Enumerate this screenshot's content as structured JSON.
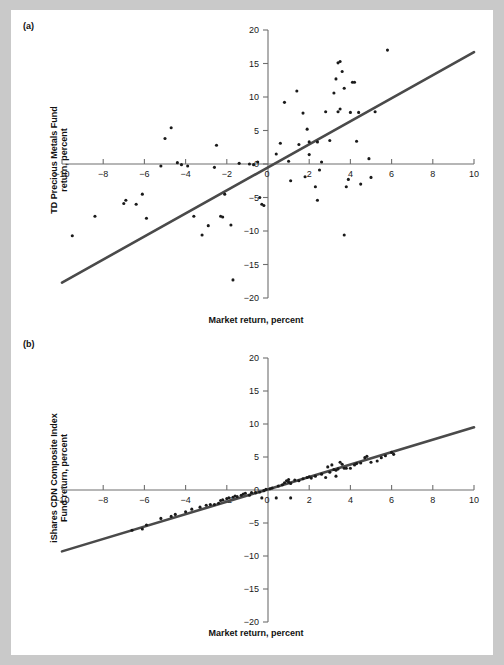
{
  "figure": {
    "background": "#c9c9c9",
    "sheet_color": "#ffffff",
    "axis_color": "#6f6f6f",
    "line_color": "#4a4a4a",
    "point_color": "#1a1a1a"
  },
  "panels": {
    "a": {
      "tag": "(a)",
      "ylabel_line1": "TD Precious Metals Fund",
      "ylabel_line2": "return, percent",
      "xlabel": "Market return, percent"
    },
    "b": {
      "tag": "(b)",
      "ylabel_line1": "iShares CDN Composite Index",
      "ylabel_line2": "Fund return, percent",
      "xlabel": "Market return, percent"
    }
  },
  "chart_data": [
    {
      "type": "scatter",
      "panel": "(a)",
      "title": "",
      "xlabel": "Market return, percent",
      "ylabel": "TD Precious Metals Fund return, percent",
      "xlim": [
        -10,
        10
      ],
      "ylim": [
        -20,
        20
      ],
      "xticks": [
        -10,
        -8,
        -6,
        -4,
        -2,
        0,
        2,
        4,
        6,
        8,
        10
      ],
      "yticks": [
        20,
        15,
        10,
        5,
        0,
        -5,
        -10,
        -15,
        -20
      ],
      "xticklabels": [
        "-10",
        "-8",
        "-6",
        "-4",
        "-2",
        "0",
        "2",
        "4",
        "6",
        "8",
        "10"
      ],
      "yticklabels": [
        "20",
        "15",
        "10",
        "5",
        "0",
        "-5",
        "-10",
        "-15",
        "-20"
      ],
      "grid": false,
      "legend": null,
      "fit_line": {
        "type": "linear",
        "slope": 1.72,
        "intercept": -0.5,
        "x_start": -10.0,
        "x_end": 10.0,
        "y_start": -17.7,
        "y_end": 16.7
      },
      "points": [
        [
          -9.5,
          -10.7
        ],
        [
          -8.4,
          -7.8
        ],
        [
          -7.0,
          -5.9
        ],
        [
          -6.9,
          -5.4
        ],
        [
          -6.4,
          -6.0
        ],
        [
          -6.1,
          -4.5
        ],
        [
          -5.9,
          -8.1
        ],
        [
          -5.2,
          -0.3
        ],
        [
          -5.0,
          3.8
        ],
        [
          -4.7,
          5.4
        ],
        [
          -4.4,
          0.2
        ],
        [
          -4.2,
          -0.1
        ],
        [
          -3.9,
          -0.3
        ],
        [
          -3.6,
          -7.8
        ],
        [
          -3.2,
          -10.6
        ],
        [
          -2.9,
          -9.2
        ],
        [
          -2.6,
          -0.5
        ],
        [
          -2.5,
          2.8
        ],
        [
          -2.3,
          -7.8
        ],
        [
          -2.2,
          -7.9
        ],
        [
          -2.1,
          -4.5
        ],
        [
          -1.8,
          -9.1
        ],
        [
          -1.7,
          -17.3
        ],
        [
          -1.4,
          0.1
        ],
        [
          -0.9,
          0.0
        ],
        [
          -0.7,
          -0.1
        ],
        [
          -0.5,
          0.3
        ],
        [
          -0.4,
          -5.0
        ],
        [
          -0.3,
          -6.0
        ],
        [
          -0.2,
          -6.2
        ],
        [
          0.4,
          1.5
        ],
        [
          0.6,
          3.1
        ],
        [
          0.8,
          9.2
        ],
        [
          1.0,
          0.4
        ],
        [
          1.1,
          -2.5
        ],
        [
          1.4,
          10.9
        ],
        [
          1.5,
          2.9
        ],
        [
          1.7,
          7.6
        ],
        [
          1.8,
          -1.9
        ],
        [
          1.9,
          5.2
        ],
        [
          2.0,
          1.4
        ],
        [
          2.0,
          3.3
        ],
        [
          2.3,
          -3.4
        ],
        [
          2.4,
          3.3
        ],
        [
          2.4,
          -5.4
        ],
        [
          2.5,
          -0.9
        ],
        [
          2.6,
          0.3
        ],
        [
          2.8,
          7.8
        ],
        [
          3.0,
          3.5
        ],
        [
          3.2,
          10.6
        ],
        [
          3.3,
          12.7
        ],
        [
          3.4,
          7.8
        ],
        [
          3.4,
          15.1
        ],
        [
          3.5,
          15.3
        ],
        [
          3.5,
          8.2
        ],
        [
          3.6,
          13.8
        ],
        [
          3.7,
          11.3
        ],
        [
          3.7,
          -10.6
        ],
        [
          3.8,
          -3.4
        ],
        [
          3.9,
          -2.3
        ],
        [
          4.0,
          7.7
        ],
        [
          4.1,
          12.2
        ],
        [
          4.2,
          12.2
        ],
        [
          4.3,
          3.4
        ],
        [
          4.4,
          7.7
        ],
        [
          4.5,
          -3.0
        ],
        [
          4.9,
          0.8
        ],
        [
          5.0,
          -2.0
        ],
        [
          5.2,
          7.8
        ],
        [
          5.8,
          17.0
        ]
      ]
    },
    {
      "type": "scatter",
      "panel": "(b)",
      "title": "",
      "xlabel": "Market return, percent",
      "ylabel": "iShares CDN Composite Index Fund return, percent",
      "xlim": [
        -10,
        10
      ],
      "ylim": [
        -20,
        20
      ],
      "xticks": [
        -10,
        -8,
        -6,
        -4,
        -2,
        0,
        2,
        4,
        6,
        8,
        10
      ],
      "yticks": [
        20,
        15,
        10,
        5,
        0,
        -5,
        -10,
        -15,
        -20
      ],
      "xticklabels": [
        "-10",
        "-8",
        "-6",
        "-4",
        "-2",
        "0",
        "2",
        "4",
        "6",
        "8",
        "10"
      ],
      "yticklabels": [
        "20",
        "15",
        "10",
        "5",
        "0",
        "-5",
        "-10",
        "-15",
        "-20"
      ],
      "grid": false,
      "legend": null,
      "fit_line": {
        "type": "linear",
        "slope": 0.94,
        "intercept": 0.05,
        "x_start": -10.0,
        "x_end": 10.0,
        "y_start": -9.3,
        "y_end": 9.5
      },
      "points": [
        [
          -6.6,
          -6.1
        ],
        [
          -6.1,
          -5.9
        ],
        [
          -5.9,
          -5.3
        ],
        [
          -5.2,
          -4.3
        ],
        [
          -4.7,
          -4.0
        ],
        [
          -4.5,
          -3.7
        ],
        [
          -4.0,
          -3.3
        ],
        [
          -3.7,
          -2.9
        ],
        [
          -3.3,
          -2.6
        ],
        [
          -3.0,
          -2.3
        ],
        [
          -2.8,
          -2.2
        ],
        [
          -2.6,
          -2.2
        ],
        [
          -2.4,
          -2.0
        ],
        [
          -2.3,
          -1.6
        ],
        [
          -2.2,
          -1.5
        ],
        [
          -2.0,
          -1.3
        ],
        [
          -1.9,
          -1.2
        ],
        [
          -1.7,
          -1.1
        ],
        [
          -1.6,
          -0.9
        ],
        [
          -1.5,
          -1.0
        ],
        [
          -1.3,
          -0.8
        ],
        [
          -1.2,
          -0.6
        ],
        [
          -1.1,
          -0.5
        ],
        [
          -0.9,
          -0.8
        ],
        [
          -0.8,
          -0.4
        ],
        [
          -0.6,
          -0.4
        ],
        [
          -0.4,
          -0.3
        ],
        [
          -0.3,
          -1.2
        ],
        [
          -0.2,
          -0.1
        ],
        [
          -0.1,
          0.1
        ],
        [
          0.1,
          0.2
        ],
        [
          0.2,
          0.3
        ],
        [
          0.4,
          -1.2
        ],
        [
          0.5,
          0.6
        ],
        [
          0.7,
          0.8
        ],
        [
          0.8,
          1.1
        ],
        [
          0.9,
          1.4
        ],
        [
          1.0,
          1.2
        ],
        [
          1.0,
          1.6
        ],
        [
          1.1,
          1.0
        ],
        [
          1.1,
          -1.2
        ],
        [
          1.3,
          1.5
        ],
        [
          1.5,
          1.4
        ],
        [
          1.7,
          1.7
        ],
        [
          1.9,
          1.9
        ],
        [
          2.0,
          2.0
        ],
        [
          2.1,
          1.8
        ],
        [
          2.3,
          2.1
        ],
        [
          2.6,
          2.4
        ],
        [
          2.8,
          1.9
        ],
        [
          2.9,
          3.5
        ],
        [
          3.0,
          2.7
        ],
        [
          3.1,
          3.8
        ],
        [
          3.2,
          3.1
        ],
        [
          3.3,
          2.1
        ],
        [
          3.3,
          3.0
        ],
        [
          3.4,
          3.2
        ],
        [
          3.5,
          4.2
        ],
        [
          3.6,
          3.9
        ],
        [
          3.7,
          3.3
        ],
        [
          3.8,
          3.3
        ],
        [
          4.0,
          3.3
        ],
        [
          4.2,
          3.8
        ],
        [
          4.3,
          4.0
        ],
        [
          4.5,
          4.1
        ],
        [
          4.7,
          4.9
        ],
        [
          4.8,
          5.1
        ],
        [
          5.0,
          4.2
        ],
        [
          5.3,
          4.4
        ],
        [
          5.5,
          4.9
        ],
        [
          5.7,
          5.2
        ],
        [
          6.0,
          5.7
        ],
        [
          6.1,
          5.4
        ]
      ]
    }
  ]
}
